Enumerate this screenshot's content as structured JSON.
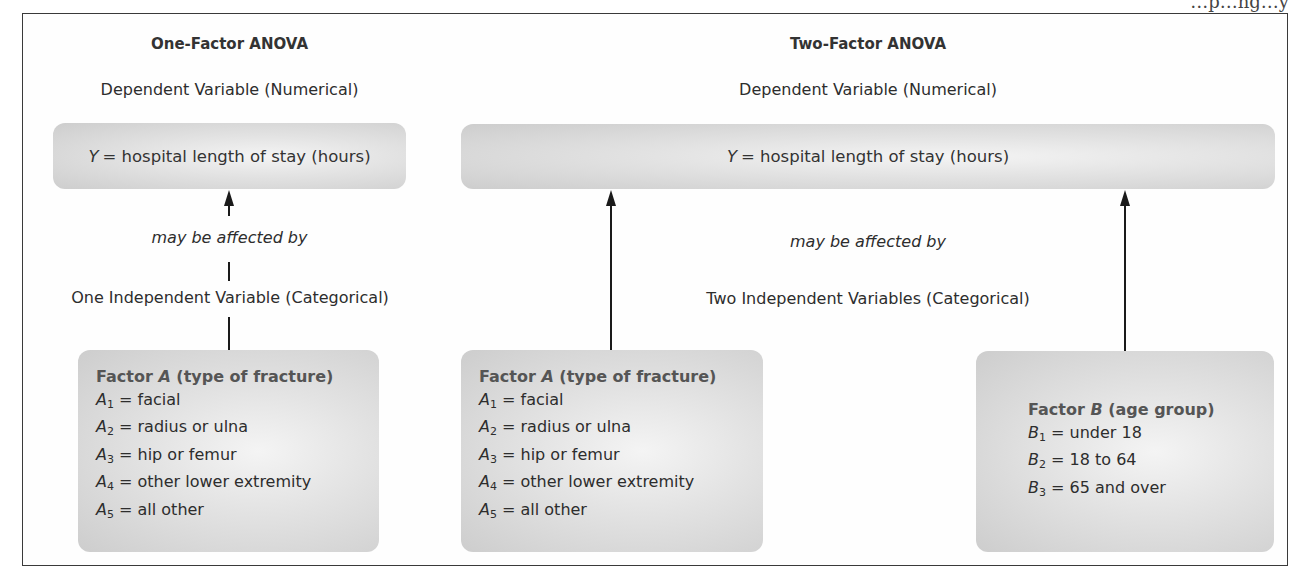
{
  "running_header": "…p…ng…y",
  "one_factor": {
    "title": "One-Factor ANOVA",
    "dependent_label": "Dependent Variable (Numerical)",
    "y_box": {
      "symbol": "Y",
      "text": "= hospital length of stay (hours)"
    },
    "relation": "may be affected by",
    "independent_label": "One Independent Variable (Categorical)",
    "factor_a": {
      "heading_prefix": "Factor ",
      "heading_symbol": "A",
      "heading_suffix": " (type of fracture)",
      "levels": [
        {
          "sym": "A",
          "sub": "1",
          "text": " = facial"
        },
        {
          "sym": "A",
          "sub": "2",
          "text": " = radius or ulna"
        },
        {
          "sym": "A",
          "sub": "3",
          "text": " = hip or femur"
        },
        {
          "sym": "A",
          "sub": "4",
          "text": " = other lower extremity"
        },
        {
          "sym": "A",
          "sub": "5",
          "text": " = all other"
        }
      ]
    }
  },
  "two_factor": {
    "title": "Two-Factor ANOVA",
    "dependent_label": "Dependent Variable (Numerical)",
    "y_box": {
      "symbol": "Y",
      "text": "= hospital length of stay (hours)"
    },
    "relation": "may be affected by",
    "independent_label": "Two Independent Variables (Categorical)",
    "factor_a": {
      "heading_prefix": "Factor ",
      "heading_symbol": "A",
      "heading_suffix": " (type of fracture)",
      "levels": [
        {
          "sym": "A",
          "sub": "1",
          "text": " = facial"
        },
        {
          "sym": "A",
          "sub": "2",
          "text": " = radius or ulna"
        },
        {
          "sym": "A",
          "sub": "3",
          "text": " = hip or femur"
        },
        {
          "sym": "A",
          "sub": "4",
          "text": " = other lower extremity"
        },
        {
          "sym": "A",
          "sub": "5",
          "text": " = all other"
        }
      ]
    },
    "factor_b": {
      "heading_prefix": "Factor ",
      "heading_symbol": "B",
      "heading_suffix": " (age group)",
      "levels": [
        {
          "sym": "B",
          "sub": "1",
          "text": " = under 18"
        },
        {
          "sym": "B",
          "sub": "2",
          "text": " = 18 to 64"
        },
        {
          "sym": "B",
          "sub": "3",
          "text": " = 65 and over"
        }
      ]
    }
  },
  "colors": {
    "box_center": "#f4f4f4",
    "box_edge": "#cdcdcd",
    "line": "#1a1a1a",
    "frame": "#3a3a3a"
  }
}
